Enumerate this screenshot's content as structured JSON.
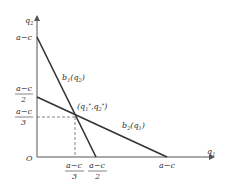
{
  "diagram": {
    "axes": {
      "x_label": "q",
      "x_sub": "1",
      "y_label": "q",
      "y_sub": "2",
      "origin": "O"
    },
    "y_ticks": [
      {
        "num": "a−c",
        "den": ""
      },
      {
        "num": "a−c",
        "den": "2"
      },
      {
        "num": "a−c",
        "den": "3"
      }
    ],
    "x_ticks": [
      {
        "num": "a−c",
        "den": "3"
      },
      {
        "num": "a−c",
        "den": "2"
      },
      {
        "num": "a−c",
        "den": ""
      }
    ],
    "curves": [
      {
        "name": "b",
        "sub": "1",
        "arg": "(q",
        "arg_sub": "2",
        "close": ")"
      },
      {
        "name": "b",
        "sub": "2",
        "arg": "(q",
        "arg_sub": "1",
        "close": ")"
      }
    ],
    "equilibrium": {
      "label_open": "(q",
      "s1": "1",
      "star": "*",
      "mid": ",q",
      "s2": "2",
      "close": ")"
    },
    "colors": {
      "line": "#333333",
      "axis": "#555555",
      "dash": "#666666"
    }
  }
}
